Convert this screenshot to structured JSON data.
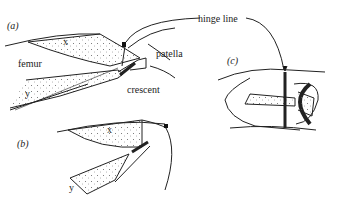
{
  "panels": {
    "a": {
      "label": "(a)",
      "parts": {
        "x": "x",
        "y": "y",
        "femur": "femur",
        "patella": "patella",
        "crescent": "crescent"
      }
    },
    "b": {
      "label": "(b)",
      "parts": {
        "x": "x",
        "y": "y"
      }
    },
    "c": {
      "label": "(c)"
    }
  },
  "callouts": {
    "hinge_line": "hinge line"
  },
  "colors": {
    "ink": "#222222",
    "background": "#ffffff"
  }
}
